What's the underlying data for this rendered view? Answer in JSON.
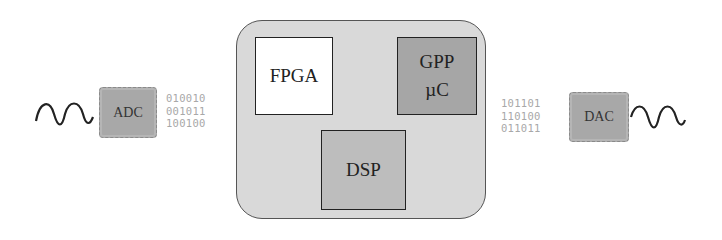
{
  "diagram": {
    "input": {
      "signal": "analog-wave",
      "converter_label": "ADC",
      "bits": [
        "010010",
        "001011",
        "100100"
      ]
    },
    "processing_unit": {
      "blocks": [
        {
          "id": "fpga",
          "lines": [
            "FPGA"
          ]
        },
        {
          "id": "gpp",
          "lines": [
            "GPP",
            "µC"
          ]
        },
        {
          "id": "dsp",
          "lines": [
            "DSP"
          ]
        }
      ],
      "connections": [
        {
          "from": "fpga",
          "to": "gpp",
          "type": "bidirectional"
        },
        {
          "from": "fpga",
          "to": "dsp",
          "type": "bidirectional"
        },
        {
          "from": "gpp",
          "to": "dsp",
          "type": "bidirectional"
        }
      ]
    },
    "output": {
      "converter_label": "DAC",
      "bits": [
        "101101",
        "110100",
        "011011"
      ],
      "signal": "analog-wave"
    },
    "colors": {
      "container_fill": "#d9d9d9",
      "fpga_fill": "#ffffff",
      "gpp_fill": "#a6a6a6",
      "dsp_fill": "#bdbdbd",
      "chip_fill": "#a8a8a8",
      "arrow": "#888888",
      "bits_text": "#a8a8a8"
    }
  }
}
